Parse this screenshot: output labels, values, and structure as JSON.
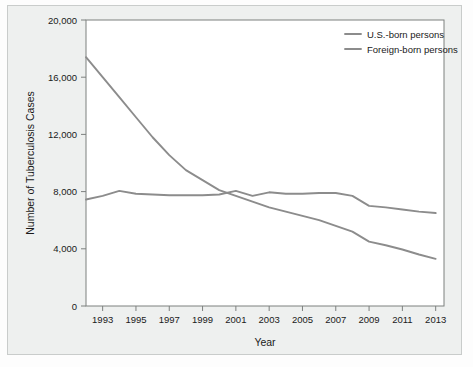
{
  "chart_data": {
    "type": "line",
    "title": "",
    "xlabel": "Year",
    "ylabel": "Number of Tuberculosis Cases",
    "xlim": [
      1992,
      2013.5
    ],
    "ylim": [
      0,
      20000
    ],
    "grid": false,
    "legend_position": "top-right",
    "x": [
      1992,
      1993,
      1994,
      1995,
      1996,
      1997,
      1998,
      1999,
      2000,
      2001,
      2002,
      2003,
      2004,
      2005,
      2006,
      2007,
      2008,
      2009,
      2010,
      2011,
      2012,
      2013
    ],
    "xticks": [
      "1993",
      "1995",
      "1997",
      "1999",
      "2001",
      "2003",
      "2005",
      "2007",
      "2009",
      "2011",
      "2013"
    ],
    "xtick_values": [
      1993,
      1995,
      1997,
      1999,
      2001,
      2003,
      2005,
      2007,
      2009,
      2011,
      2013
    ],
    "yticks": [
      "0",
      "4,000",
      "8,000",
      "12,000",
      "16,000",
      "20,000"
    ],
    "ytick_values": [
      0,
      4000,
      8000,
      12000,
      16000,
      20000
    ],
    "series": [
      {
        "name": "U.S.-born persons",
        "color": "#8c8c8c",
        "values": [
          17400,
          16000,
          14600,
          13200,
          11800,
          10550,
          9500,
          8800,
          8100,
          7700,
          7300,
          6900,
          6600,
          6300,
          6000,
          5600,
          5200,
          4500,
          4250,
          3950,
          3600,
          3300
        ]
      },
      {
        "name": "Foreign-born persons",
        "color": "#8c8c8c",
        "values": [
          7450,
          7700,
          8050,
          7850,
          7800,
          7750,
          7750,
          7750,
          7800,
          8050,
          7700,
          7950,
          7850,
          7850,
          7900,
          7900,
          7700,
          7000,
          6900,
          6750,
          6600,
          6500
        ]
      }
    ]
  },
  "axis": {
    "y_title": "Number of Tuberculosis Cases",
    "x_title": "Year"
  },
  "legend": {
    "items": [
      {
        "label": "U.S.-born persons",
        "color": "#8c8c8c"
      },
      {
        "label": "Foreign-born persons",
        "color": "#8c8c8c"
      }
    ]
  },
  "colors": {
    "figure_background": "#eef0ef",
    "plot_background": "#ffffff",
    "axis": "#7d807f",
    "text": "#1a1a1a",
    "series": "#8c8c8c"
  }
}
